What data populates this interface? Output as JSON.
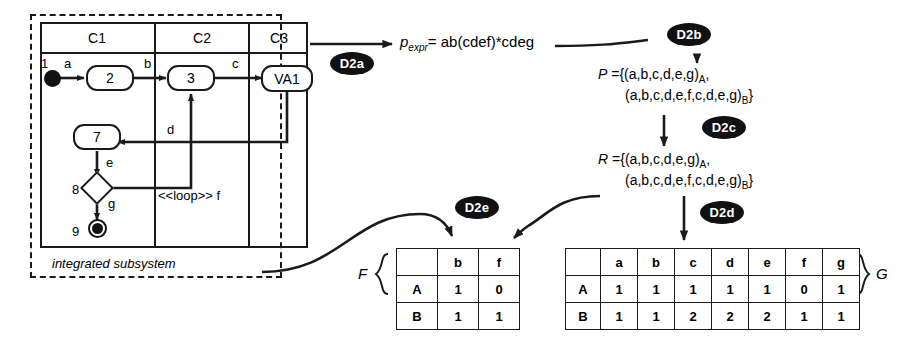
{
  "diagram": {
    "subsystem_label": "integrated subsystem",
    "lanes": [
      {
        "id": "C1",
        "label": "C1"
      },
      {
        "id": "C2",
        "label": "C2"
      },
      {
        "id": "C3",
        "label": "C3"
      }
    ],
    "nodes": [
      {
        "id": "n1",
        "number": "1",
        "label": "",
        "type": "initial"
      },
      {
        "id": "n2",
        "number": "",
        "label": "2",
        "type": "action"
      },
      {
        "id": "n3",
        "number": "",
        "label": "3",
        "type": "action"
      },
      {
        "id": "n4",
        "number": "",
        "label": "VA1",
        "type": "action"
      },
      {
        "id": "n7",
        "number": "",
        "label": "7",
        "type": "action"
      },
      {
        "id": "n8",
        "number": "8",
        "label": "",
        "type": "decision"
      },
      {
        "id": "n9",
        "number": "9",
        "label": "",
        "type": "final"
      }
    ],
    "edge_labels": {
      "a": "a",
      "b": "b",
      "c": "c",
      "d": "d",
      "e": "e",
      "g": "g",
      "loop": "<<loop>> f"
    }
  },
  "steps": [
    {
      "id": "D2a",
      "label": "D2a"
    },
    {
      "id": "D2b",
      "label": "D2b"
    },
    {
      "id": "D2c",
      "label": "D2c"
    },
    {
      "id": "D2d",
      "label": "D2d"
    },
    {
      "id": "D2e",
      "label": "D2e"
    }
  ],
  "expression": {
    "symbol": "p",
    "symbol_sub": "expr",
    "equals": "=",
    "value": "ab(cdef)*cdeg"
  },
  "path_set_P": {
    "name": "P",
    "equals": "=",
    "line1": "{(a,b,c,d,e,g)",
    "line1_sub": "A",
    "line1_tail": ",",
    "line2": "(a,b,c,d,e,f,c,d,e,g)",
    "line2_sub": "B",
    "line2_tail": "}"
  },
  "path_set_R": {
    "name": "R",
    "equals": "=",
    "line1": "{(a,b,c,d,e,g)",
    "line1_sub": "A",
    "line1_tail": ",",
    "line2": "(a,b,c,d,e,f,c,d,e,g)",
    "line2_sub": "B",
    "line2_tail": "}"
  },
  "table_F": {
    "name": "F",
    "corner": "",
    "columns": [
      "b",
      "f"
    ],
    "rows": [
      {
        "label": "A",
        "values": [
          "1",
          "0"
        ]
      },
      {
        "label": "B",
        "values": [
          "1",
          "1"
        ]
      }
    ]
  },
  "table_G": {
    "name": "G",
    "corner": "",
    "columns": [
      "a",
      "b",
      "c",
      "d",
      "e",
      "f",
      "g"
    ],
    "rows": [
      {
        "label": "A",
        "values": [
          "1",
          "1",
          "1",
          "1",
          "1",
          "0",
          "1"
        ]
      },
      {
        "label": "B",
        "values": [
          "1",
          "1",
          "2",
          "2",
          "2",
          "1",
          "1"
        ]
      }
    ]
  },
  "colors": {
    "stroke": "#1a1a1a",
    "badge_bg": "#111111",
    "badge_fg": "#ffffff",
    "background": "#ffffff"
  }
}
